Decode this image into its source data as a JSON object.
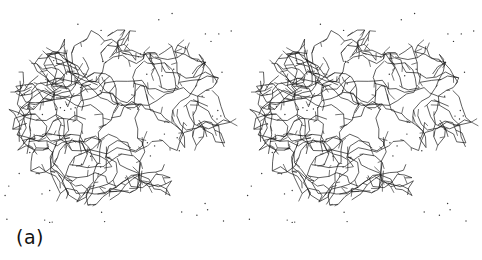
{
  "figure": {
    "label": "(a)",
    "type": "stereo pair",
    "panels": [
      {
        "name": "left-view"
      },
      {
        "name": "right-view"
      }
    ],
    "colors": {
      "background": "#ffffff",
      "line": "#1a1a1a",
      "dots": "#333333"
    }
  }
}
